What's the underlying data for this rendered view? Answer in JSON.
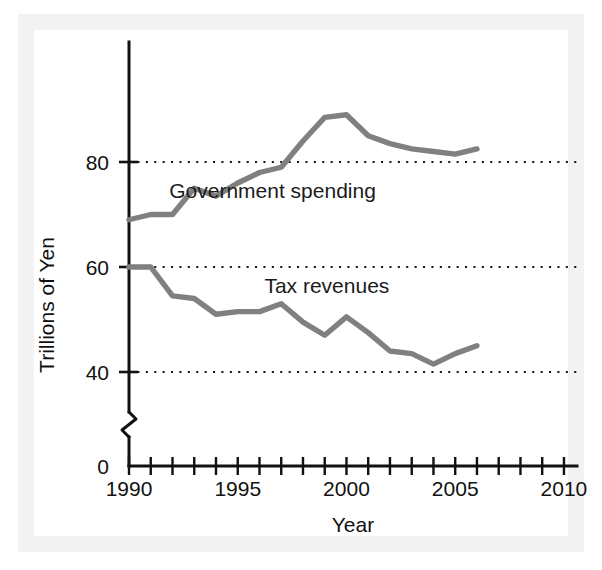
{
  "chart_data": {
    "type": "line",
    "title": "",
    "xlabel": "Year",
    "ylabel": "Trillions of Yen",
    "xlim": [
      1990,
      2010.6
    ],
    "ylim": [
      34,
      93
    ],
    "grid": true,
    "gridlines": [
      40,
      60,
      80
    ],
    "legend_position": "inline-annotation",
    "y_axis_broken": true,
    "y_tick_labels": [
      "0",
      "40",
      "60",
      "80"
    ],
    "x_tick_labels": [
      "1990",
      "1995",
      "2000",
      "2005",
      "2010"
    ],
    "x_tick_label_values": [
      1990,
      1995,
      2000,
      2005,
      2010
    ],
    "x_minor_tick_step": 1,
    "x": [
      1990,
      1991,
      1992,
      1993,
      1994,
      1995,
      1996,
      1997,
      1998,
      1999,
      2000,
      2001,
      2002,
      2003,
      2004,
      2005,
      2006
    ],
    "series": [
      {
        "name": "Government spending",
        "color": "#808080",
        "label_x": 1996.6,
        "label_y": 73.2,
        "values": [
          69.0,
          70.0,
          70.0,
          75.0,
          73.5,
          76.0,
          78.0,
          79.0,
          84.0,
          88.5,
          89.0,
          85.0,
          83.5,
          82.5,
          82.0,
          81.5,
          82.5
        ]
      },
      {
        "name": "Tax revenues",
        "color": "#808080",
        "label_x": 1999.1,
        "label_y": 55.0,
        "values": [
          60.0,
          60.0,
          54.5,
          54.0,
          51.0,
          51.5,
          51.5,
          53.0,
          49.5,
          47.0,
          50.5,
          47.5,
          44.0,
          43.5,
          41.5,
          43.5,
          45.0
        ]
      }
    ]
  },
  "axes": {
    "y_label": "Trillions of Yen",
    "x_label": "Year",
    "y_ticks": [
      {
        "label": "80",
        "value": 80
      },
      {
        "label": "60",
        "value": 60
      },
      {
        "label": "40",
        "value": 40
      },
      {
        "label": "0",
        "value": 0
      }
    ],
    "x_ticks": [
      {
        "label": "1990",
        "value": 1990
      },
      {
        "label": "1995",
        "value": 1995
      },
      {
        "label": "2000",
        "value": 2000
      },
      {
        "label": "2005",
        "value": 2005
      },
      {
        "label": "2010",
        "value": 2010
      }
    ]
  },
  "annotations": [
    {
      "text": "Government spending"
    },
    {
      "text": "Tax revenues"
    }
  ],
  "style": {
    "line_color": "#808080",
    "axis_color": "#111111",
    "grid_color": "#1a1a1a",
    "background": "#ffffff",
    "page_border": "#f2f2f2"
  }
}
